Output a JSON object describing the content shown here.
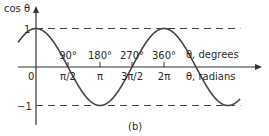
{
  "chart_data": {
    "type": "line",
    "title": "",
    "caption": "(b)",
    "ylabel": "cos θ",
    "xlabel_degrees": "θ, degrees",
    "xlabel_radians": "θ, radians",
    "function": "cos",
    "x_range_degrees": [
      -50,
      575
    ],
    "ylim": [
      -1,
      1
    ],
    "y_ticks": [
      {
        "value": 1,
        "label": "1"
      },
      {
        "value": -1,
        "label": "−1"
      }
    ],
    "origin_label": "0",
    "x_ticks": [
      {
        "deg": 90,
        "deg_label": "90°",
        "rad_label": "π/2"
      },
      {
        "deg": 180,
        "deg_label": "180°",
        "rad_label": "π"
      },
      {
        "deg": 270,
        "deg_label": "270°",
        "rad_label": "3π/2"
      },
      {
        "deg": 360,
        "deg_label": "360°",
        "rad_label": "2π"
      }
    ],
    "reference_lines": [
      {
        "value": 1,
        "style": "dashed"
      },
      {
        "value": -1,
        "style": "dashed"
      }
    ],
    "curve_color": "#444444",
    "grid": false
  }
}
